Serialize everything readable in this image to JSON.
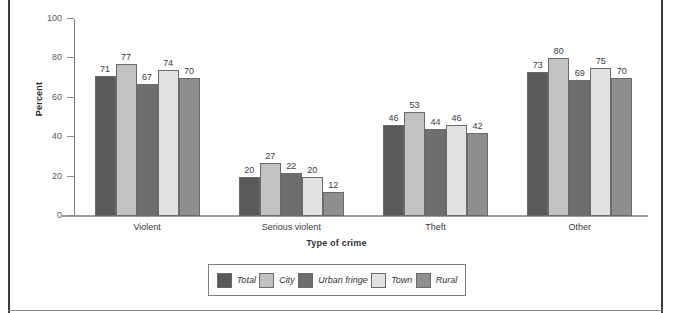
{
  "figure": {
    "top_caption": "",
    "background": "#ffffff",
    "frame_color": "#3a3a3a"
  },
  "chart_data": {
    "type": "bar",
    "title": "",
    "subtitle": "",
    "xlabel": "Type of crime",
    "ylabel": "Percent",
    "categories": [
      "Violent",
      "Serious violent",
      "Theft",
      "Other"
    ],
    "series": [
      {
        "name": "Total",
        "color": "#595959",
        "values": [
          71,
          20,
          46,
          73
        ]
      },
      {
        "name": "City",
        "color": "#c2c2c2",
        "values": [
          77,
          27,
          53,
          80
        ]
      },
      {
        "name": "Urban fringe",
        "color": "#6e6e6e",
        "values": [
          67,
          22,
          44,
          69
        ]
      },
      {
        "name": "Town",
        "color": "#e2e2e2",
        "values": [
          74,
          20,
          46,
          75
        ]
      },
      {
        "name": "Rural",
        "color": "#8f8f8f",
        "values": [
          70,
          12,
          42,
          70
        ]
      }
    ],
    "ylim": [
      0,
      100
    ],
    "yticks": [
      0,
      20,
      40,
      60,
      80,
      100
    ],
    "grid": false,
    "legend_position": "bottom",
    "value_labels": true
  },
  "legend": {
    "items": [
      {
        "label": "Total",
        "color": "#595959"
      },
      {
        "label": "City",
        "color": "#c2c2c2"
      },
      {
        "label": "Urban fringe",
        "color": "#6e6e6e"
      },
      {
        "label": "Town",
        "color": "#e2e2e2"
      },
      {
        "label": "Rural",
        "color": "#8f8f8f"
      }
    ]
  }
}
